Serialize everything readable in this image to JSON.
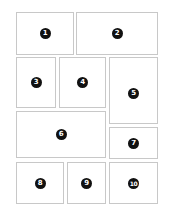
{
  "diagram": {
    "title": "",
    "panels": [
      {
        "label": "1",
        "x": 16,
        "y": 12,
        "w": 58,
        "h": 43
      },
      {
        "label": "2",
        "x": 76,
        "y": 12,
        "w": 82,
        "h": 43
      },
      {
        "label": "3",
        "x": 16,
        "y": 57,
        "w": 40,
        "h": 51
      },
      {
        "label": "4",
        "x": 59,
        "y": 57,
        "w": 47,
        "h": 51
      },
      {
        "label": "5",
        "x": 109,
        "y": 57,
        "w": 49,
        "h": 67
      },
      {
        "label": "6",
        "x": 16,
        "y": 111,
        "w": 90,
        "h": 47
      },
      {
        "label": "7",
        "x": 109,
        "y": 127,
        "w": 49,
        "h": 32
      },
      {
        "label": "8",
        "x": 16,
        "y": 162,
        "w": 48,
        "h": 42
      },
      {
        "label": "9",
        "x": 67,
        "y": 162,
        "w": 39,
        "h": 42
      },
      {
        "label": "10",
        "x": 109,
        "y": 162,
        "w": 49,
        "h": 42
      }
    ],
    "colors": {
      "border": "#c8c8c8",
      "badge": "#111111",
      "badge_text": "#ffffff"
    }
  }
}
